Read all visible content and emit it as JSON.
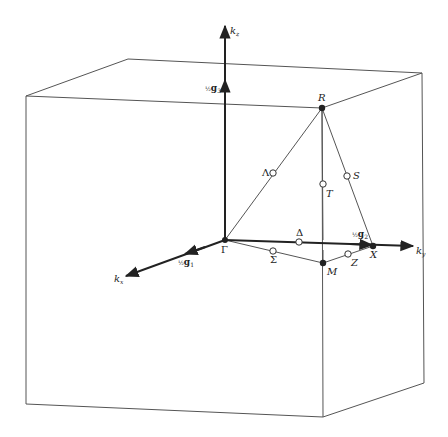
{
  "figure": {
    "colors": {
      "line": "#555555",
      "axis": "#222222",
      "background": "#ffffff"
    },
    "axes": {
      "kx": {
        "label": "k",
        "subscript": "x"
      },
      "ky": {
        "label": "k",
        "subscript": "y"
      },
      "kz": {
        "label": "k",
        "subscript": "z"
      }
    },
    "reciprocal_vectors": {
      "g1": {
        "frac": "½",
        "label": "g",
        "subscript": "1"
      },
      "g2": {
        "frac": "½",
        "label": "g",
        "subscript": "2"
      },
      "g3": {
        "frac": "½",
        "label": "g",
        "subscript": "3"
      }
    },
    "points": {
      "Gamma": {
        "label": "Γ",
        "type": "filled"
      },
      "R": {
        "label": "R",
        "type": "filled"
      },
      "X": {
        "label": "X",
        "type": "filled"
      },
      "M": {
        "label": "M",
        "type": "filled"
      },
      "Lambda": {
        "label": "Λ",
        "type": "open"
      },
      "Delta": {
        "label": "Δ",
        "type": "open"
      },
      "Sigma": {
        "label": "Σ",
        "type": "open"
      },
      "S": {
        "label": "S",
        "type": "open"
      },
      "T": {
        "label": "T",
        "type": "open"
      },
      "Z": {
        "label": "Z",
        "type": "open"
      }
    }
  }
}
